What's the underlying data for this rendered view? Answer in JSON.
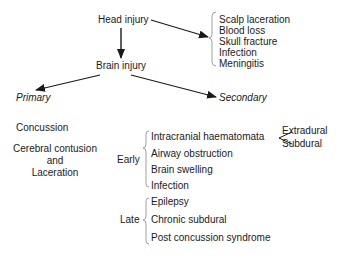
{
  "diagram": {
    "root": "Head injury",
    "head_injury_complications": [
      "Scalp laceration",
      "Blood loss",
      "Skull fracture",
      "Infection",
      "Meningitis"
    ],
    "child": "Brain injury",
    "branches": {
      "primary": {
        "label": "Primary",
        "items": [
          "Concussion",
          "Cerebral contusion",
          "and",
          "Laceration"
        ]
      },
      "secondary": {
        "label": "Secondary",
        "early": {
          "label": "Early",
          "items": [
            "Intracranial haematomata",
            "Airway obstruction",
            "Brain swelling",
            "Infection"
          ],
          "haematomata_types": [
            "Extradural",
            "Subdural"
          ]
        },
        "late": {
          "label": "Late",
          "items": [
            "Epilepsy",
            "Chronic subdural",
            "Post concussion syndrome"
          ]
        }
      }
    }
  },
  "colors": {
    "text": "#1a1a1a",
    "lines": "#1a1a1a",
    "brace": "#888888"
  }
}
